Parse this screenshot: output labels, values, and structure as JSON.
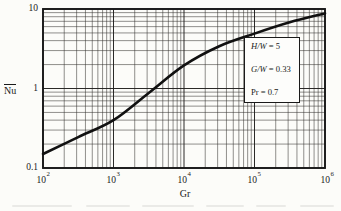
{
  "chart_data": {
    "type": "line",
    "series_name": "mean Nusselt number vs Grashof number",
    "x_scale": "log",
    "y_scale": "log",
    "xlim": [
      100,
      1000000
    ],
    "ylim": [
      0.1,
      10
    ],
    "xlabel": "Gr",
    "ylabel": "Nu",
    "x": [
      100,
      316,
      1000,
      3160,
      10000,
      31600,
      100000,
      316000,
      1000000
    ],
    "y": [
      0.15,
      0.245,
      0.4,
      0.88,
      1.95,
      3.4,
      4.9,
      6.8,
      8.8
    ],
    "grid": "full log-log grid with minor decade lines",
    "legend_position": "inside-right box",
    "annotations": [
      {
        "label": "H/W",
        "eq": "= 5"
      },
      {
        "label": "G/W",
        "eq": "= 0.33"
      },
      {
        "label": "Pr",
        "eq": "= 0.7"
      }
    ],
    "x_tick_labels": [
      {
        "base": "10",
        "exp": "2"
      },
      {
        "base": "10",
        "exp": "3"
      },
      {
        "base": "10",
        "exp": "4"
      },
      {
        "base": "10",
        "exp": "5"
      },
      {
        "base": "10",
        "exp": "6"
      }
    ],
    "y_tick_labels": [
      "10",
      "1",
      "0.1"
    ]
  },
  "style": {
    "ink": "#1a1a1a",
    "paper": "#fcfcf9",
    "curve_color": "#111111"
  }
}
